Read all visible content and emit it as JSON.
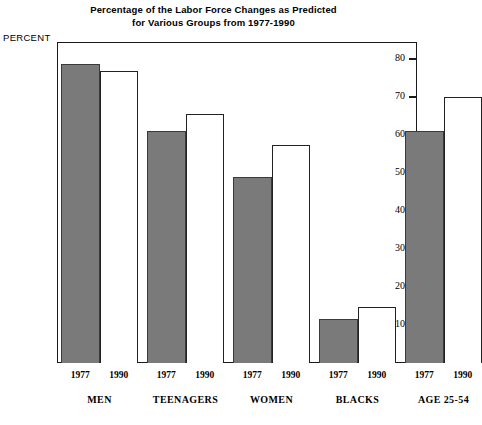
{
  "title_lines": [
    "Percentage of the Labor Force Changes as Predicted",
    "for Various Groups from 1977-1990"
  ],
  "y_axis_caption": "PERCENT",
  "colors": {
    "bar_1977_fill": "#7a7a7a",
    "bar_1990_fill": "#ffffff",
    "bar_outline": "#222222",
    "frame": "#1a1a1a",
    "text": "#000000"
  },
  "chart_data": {
    "type": "bar",
    "title": "Percentage of the Labor Force Changes as Predicted for Various Groups from 1977-1990",
    "xlabel": "",
    "ylabel": "PERCENT",
    "ylim": [
      0,
      85
    ],
    "yticks": [
      10,
      20,
      30,
      40,
      50,
      60,
      70,
      80
    ],
    "grid": false,
    "legend": "none",
    "categories": [
      "MEN",
      "TEENAGERS",
      "WOMEN",
      "BLACKS",
      "AGE 25-54"
    ],
    "series": [
      {
        "name": "1977",
        "values": [
          78.7,
          61.0,
          49.0,
          11.5,
          61.0
        ]
      },
      {
        "name": "1990",
        "values": [
          76.9,
          65.5,
          57.3,
          14.8,
          70.0
        ]
      }
    ],
    "bars": [
      {
        "group": "MEN",
        "year": "1977",
        "value": 78.7,
        "style": "filled"
      },
      {
        "group": "MEN",
        "year": "1990",
        "value": 76.9,
        "style": "open"
      },
      {
        "group": "TEENAGERS",
        "year": "1977",
        "value": 61.0,
        "style": "filled"
      },
      {
        "group": "TEENAGERS",
        "year": "1990",
        "value": 65.5,
        "style": "open"
      },
      {
        "group": "WOMEN",
        "year": "1977",
        "value": 49.0,
        "style": "filled"
      },
      {
        "group": "WOMEN",
        "year": "1990",
        "value": 57.3,
        "style": "open"
      },
      {
        "group": "BLACKS",
        "year": "1977",
        "value": 11.5,
        "style": "filled"
      },
      {
        "group": "BLACKS",
        "year": "1990",
        "value": 14.8,
        "style": "open"
      },
      {
        "group": "AGE 25-54",
        "year": "1977",
        "value": 61.0,
        "style": "filled"
      },
      {
        "group": "AGE 25-54",
        "year": "1990",
        "value": 70.0,
        "style": "open"
      }
    ]
  }
}
